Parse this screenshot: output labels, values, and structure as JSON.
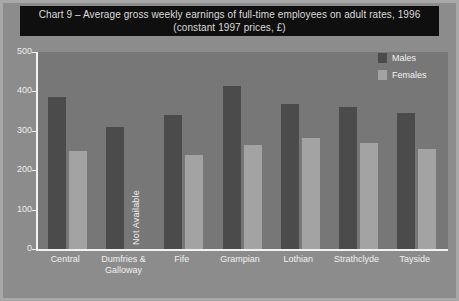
{
  "title": "Chart 9 – Average gross weekly earnings of full-time employees on adult rates, 1996 (constant 1997 prices, £)",
  "legend": {
    "males_label": "Males",
    "females_label": "Females"
  },
  "annotations": {
    "not_available": "Not Available"
  },
  "source_note": "",
  "colors": {
    "males_bar": "#4b4b4b",
    "females_bar": "#a3a3a3",
    "plot_background": "#777777",
    "page_background": "#8c8c8c",
    "frame": "#a8a8a8",
    "title_bar": "#0f0f0f",
    "axis": "#f2f2f2",
    "text": "#f0f0f0"
  },
  "chart_data": {
    "type": "bar",
    "title": "Chart 9 – Average gross weekly earnings of full-time employees on adult rates, 1996 (constant 1997 prices, £)",
    "xlabel": "",
    "ylabel": "",
    "ylim": [
      0,
      500
    ],
    "yticks": [
      0,
      100,
      200,
      300,
      400,
      500
    ],
    "ytick_labels": [
      "0",
      "100",
      "200",
      "300",
      "400",
      "500"
    ],
    "grid": false,
    "legend_position": "top-right",
    "categories": [
      "Central",
      "Dumfries & Galloway",
      "Fife",
      "Grampian",
      "Lothian",
      "Strathclyde",
      "Tayside"
    ],
    "series": [
      {
        "name": "Males",
        "color": "#4b4b4b",
        "values": [
          385,
          310,
          340,
          415,
          368,
          360,
          345
        ]
      },
      {
        "name": "Females",
        "color": "#a3a3a3",
        "values": [
          248,
          null,
          238,
          265,
          282,
          268,
          255
        ],
        "notes": {
          "1": "Not Available"
        }
      }
    ]
  }
}
